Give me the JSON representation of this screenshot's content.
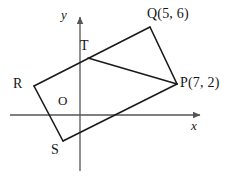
{
  "figure": {
    "kind": "coordinate-geometry-diagram",
    "stroke_color": "#1a1a1a",
    "axis_color": "#555555",
    "background_color": "#ffffff"
  },
  "axes": {
    "x_label": "x",
    "y_label": "y",
    "origin_label": "O",
    "x_axis": {
      "x1": 10,
      "y1": 115,
      "x2": 206,
      "y2": 115,
      "arrow": "right"
    },
    "y_axis": {
      "x1": 80,
      "y1": 171,
      "x2": 80,
      "y2": 11,
      "arrow": "up"
    }
  },
  "points": {
    "Q": {
      "label": "Q(5, 6)",
      "name": "Q",
      "coords": "(5, 6)",
      "px": 150,
      "py": 27
    },
    "P": {
      "label": "P(7, 2)",
      "name": "P",
      "coords": "(7, 2)",
      "px": 177,
      "py": 84
    },
    "R": {
      "label": "R",
      "name": "R",
      "coords": "",
      "px": 34,
      "py": 86
    },
    "S": {
      "label": "S",
      "name": "S",
      "coords": "",
      "px": 63,
      "py": 141
    },
    "T": {
      "label": "T",
      "name": "T",
      "coords": "",
      "px": 88,
      "py": 58
    }
  },
  "segments": [
    {
      "name": "RQ",
      "from": "R",
      "to": "Q",
      "d": "M 34 86 L 150 27"
    },
    {
      "name": "QP",
      "from": "Q",
      "to": "P",
      "d": "M 150 27 L 177 84"
    },
    {
      "name": "PS",
      "from": "P",
      "to": "S",
      "d": "M 177 84 L 63 141"
    },
    {
      "name": "SR",
      "from": "S",
      "to": "R",
      "d": "M 63 141 L 34 86"
    },
    {
      "name": "TP",
      "from": "T",
      "to": "P",
      "d": "M 88 58 L 177 84"
    }
  ]
}
